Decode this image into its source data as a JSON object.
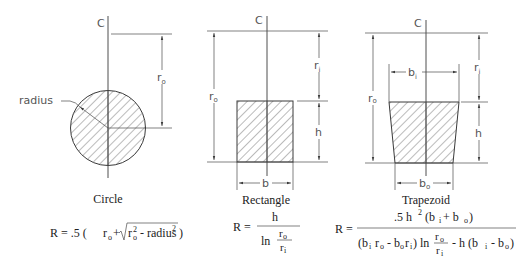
{
  "diagram": {
    "colors": {
      "line": "#3a3a3a",
      "text": "#222222",
      "label": "#555555",
      "hatch": "#555555"
    },
    "centerline_label": "C",
    "circle": {
      "caption": "Circle",
      "labels": {
        "radius": "radius",
        "r": "r",
        "r_sub": "o"
      },
      "formula": {
        "lhs": "R = .5 (",
        "r": "r",
        "r_sub": "o",
        "plus": "+",
        "root_r": "r",
        "root_sup": "2",
        "root_sub": "o",
        "minus_radius": " - radius",
        "radius_sup": "2",
        "close": ")"
      }
    },
    "rectangle": {
      "caption": "Rectangle",
      "labels": {
        "r_o": "r",
        "r_o_sub": "o",
        "r_i": "r",
        "r_i_sub": "i",
        "h": "h",
        "b": "b"
      },
      "formula": {
        "lhs": "R =",
        "numerator": "h",
        "ln": "ln",
        "inner_num": "r",
        "inner_num_sub": "o",
        "inner_den": "r",
        "inner_den_sub": "i"
      }
    },
    "trapezoid": {
      "caption": "Trapezoid",
      "labels": {
        "r_o": "r",
        "r_o_sub": "o",
        "r_i": "r",
        "r_i_sub": "i",
        "h": "h",
        "b_i": "b",
        "b_i_sub": "i",
        "b_o": "b",
        "b_o_sub": "o"
      },
      "formula": {
        "lhs": "R =",
        "numerator": ".5 h",
        "numerator_sup": "2",
        "numerator_rest": " (b",
        "numerator_bi_sub": "i",
        "numerator_plus": "+ b",
        "numerator_bo_sub": "o",
        "numerator_close": ")",
        "den_open": "(b",
        "den_bi_sub": "i",
        "den_r": " r",
        "den_ro_sub": "o",
        "den_minus": " - b",
        "den_bo_sub": "o",
        "den_r2": "r",
        "den_ri_sub": "i",
        "den_close": ")",
        "ln": "ln",
        "inner_num": "r",
        "inner_num_sub": "o",
        "inner_den": "r",
        "inner_den_sub": "i",
        "tail": "- h (b",
        "tail_bi_sub": "i",
        "tail_minus": " - b",
        "tail_bo_sub": "o",
        "tail_close": ")"
      }
    }
  }
}
